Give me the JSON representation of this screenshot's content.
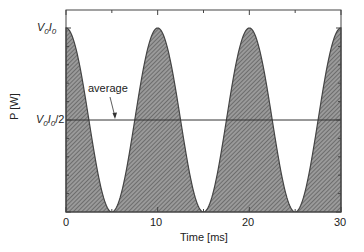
{
  "chart_data": {
    "type": "area",
    "title": "",
    "xlabel": "Time [ms]",
    "ylabel": "P [W]",
    "xlim": [
      0,
      30
    ],
    "ylim": [
      0,
      1.2
    ],
    "x_ticks": [
      "0",
      "10",
      "20",
      "30"
    ],
    "y_ticks": [
      "V0I0",
      "V0I0/2"
    ],
    "series": [
      {
        "name": "P(t) = V0I0·cos²(πt/10)",
        "fill": "hatched gray",
        "x": [
          0,
          2.5,
          5,
          7.5,
          10,
          12.5,
          15,
          17.5,
          20,
          22.5,
          25,
          27.5,
          30
        ],
        "values": [
          1,
          0.5,
          0,
          0.5,
          1,
          0.5,
          0,
          0.5,
          1,
          0.5,
          0,
          0.5,
          1
        ]
      },
      {
        "name": "average",
        "values": [
          0.5,
          0.5
        ],
        "x": [
          0,
          30
        ]
      }
    ],
    "annotations": [
      {
        "text": "average",
        "points_to": "average line"
      }
    ],
    "grid": false,
    "legend": "none"
  },
  "labels": {
    "ylabel": "P [W]",
    "xlabel": "Time [ms]",
    "ytick_peak_main": "V",
    "ytick_peak_sub1": "0",
    "ytick_peak_mid": "I",
    "ytick_peak_sub2": "0",
    "ytick_half_suffix": "/2",
    "annotation": "average",
    "xticks": [
      "0",
      "10",
      "20",
      "30"
    ]
  }
}
